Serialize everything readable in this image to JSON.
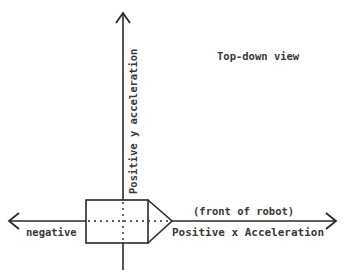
{
  "diagram": {
    "title": "Top-down view",
    "y_axis_label": "Positive y acceleration",
    "x_axis_positive_label": "Positive x Acceleration",
    "x_axis_negative_label": "negative",
    "front_label": "(front of robot)",
    "colors": {
      "line": "#2a2a2a",
      "text": "#3a3a3a",
      "background": "#ffffff"
    }
  }
}
